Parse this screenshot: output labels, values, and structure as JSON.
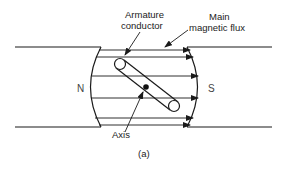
{
  "diagram": {
    "labels": {
      "armature_line1": "Armature",
      "armature_line2": "conductor",
      "flux_line1": "Main",
      "flux_line2": "magnetic flux",
      "north": "N",
      "south": "S",
      "axis": "Axis",
      "caption": "(a)"
    },
    "colors": {
      "stroke": "#1a1a1a",
      "background": "#ffffff"
    }
  }
}
